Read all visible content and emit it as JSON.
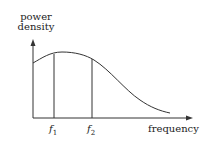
{
  "diagram": {
    "type": "power spectral density curve",
    "y_axis_label_line1": "power",
    "y_axis_label_line2": "density",
    "x_axis_label": "frequency",
    "markers": [
      {
        "symbol": "f",
        "subscript": "1"
      },
      {
        "symbol": "f",
        "subscript": "2"
      }
    ],
    "colors": {
      "line": "#333333",
      "background": "#ffffff"
    }
  }
}
